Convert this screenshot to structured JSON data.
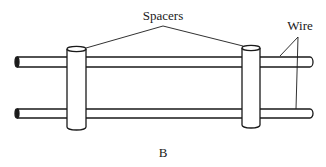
{
  "diagram": {
    "labels": {
      "spacers": "Spacers",
      "wire": "Wire",
      "caption": "B"
    },
    "components": {
      "wires": [
        {
          "name": "top-wire",
          "y_top": 57,
          "y_bottom": 67,
          "x_start": 15,
          "x_end": 313
        },
        {
          "name": "bottom-wire",
          "y_top": 109,
          "y_bottom": 118,
          "x_start": 15,
          "x_end": 313
        }
      ],
      "spacers": [
        {
          "name": "left-spacer",
          "x_left": 67,
          "x_right": 86,
          "y_top": 49,
          "y_bottom": 130
        },
        {
          "name": "right-spacer",
          "x_left": 242,
          "x_right": 260,
          "y_top": 48,
          "y_bottom": 128
        }
      ]
    },
    "colors": {
      "stroke": "#1a1a1a",
      "fill": "#ffffff"
    }
  }
}
